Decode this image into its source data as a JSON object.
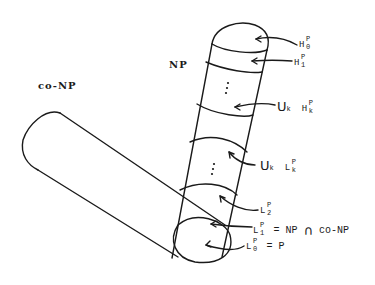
{
  "diagram": {
    "title_labels": {
      "np": "NP",
      "co_np": "co-NP"
    },
    "hierarchy_labels": [
      {
        "id": "h0",
        "base": "H",
        "sup": "P",
        "sub": "0",
        "prefix": "",
        "suffix": ""
      },
      {
        "id": "h1",
        "base": "H",
        "sup": "P",
        "sub": "1",
        "prefix": "",
        "suffix": ""
      },
      {
        "id": "hk",
        "base": "H",
        "sup": "P",
        "sub": "k",
        "prefix": "U",
        "prefix_sub": "k",
        "suffix": ""
      },
      {
        "id": "lk",
        "base": "L",
        "sup": "P",
        "sub": "k",
        "prefix": "U",
        "prefix_sub": "k",
        "suffix": ""
      },
      {
        "id": "l2",
        "base": "L",
        "sup": "P",
        "sub": "2",
        "prefix": "",
        "suffix": ""
      },
      {
        "id": "l1",
        "base": "L",
        "sup": "P",
        "sub": "1",
        "prefix": "",
        "suffix": "= NP",
        "union": "∩",
        "suffix2": "co-NP"
      },
      {
        "id": "l0",
        "base": "L",
        "sup": "P",
        "sub": "0",
        "prefix": "",
        "suffix": "= P"
      }
    ],
    "ellipsis": "⋮",
    "colors": {
      "ink": "#1a1a1a",
      "background": "#ffffff"
    }
  }
}
